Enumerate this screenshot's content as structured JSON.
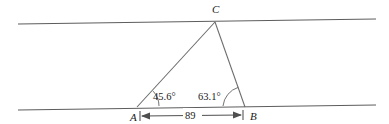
{
  "figure": {
    "kind": "geometry-diagram",
    "background_color": "#ffffff",
    "line_color": "#5d5d5d",
    "text_color": "#1a1a1a"
  },
  "points": {
    "a": {
      "label": "A",
      "x": 137,
      "y": 107
    },
    "b": {
      "label": "B",
      "x": 245,
      "y": 107
    },
    "c": {
      "label": "C",
      "x": 215,
      "y": 22
    }
  },
  "angles": [
    {
      "at": "A",
      "value": "45.6",
      "unit": "°",
      "text": "45.6°"
    },
    {
      "at": "B",
      "value": "63.1",
      "unit": "°",
      "text": "63.1°"
    }
  ],
  "dimension": {
    "label": "89",
    "from": "A",
    "to": "B",
    "style": "double-arrow"
  },
  "lines": {
    "top": {
      "name": "upper-parallel-line",
      "x1": 18,
      "y1": 24,
      "x2": 376,
      "y2": 19
    },
    "bottom": {
      "name": "lower-parallel-line",
      "x1": 18,
      "y1": 110,
      "x2": 376,
      "y2": 105
    }
  }
}
